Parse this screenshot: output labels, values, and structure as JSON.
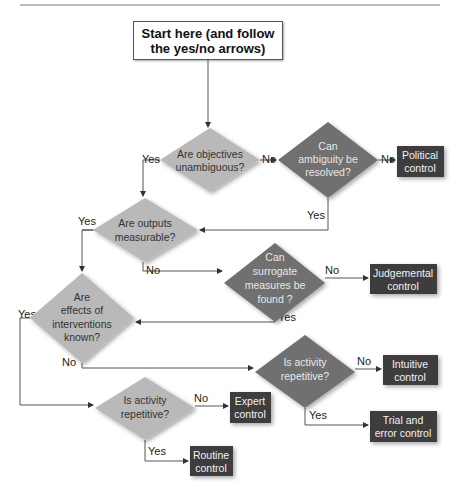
{
  "start": {
    "line1": "Start here (and follow",
    "line2": "the yes/no arrows)"
  },
  "colors": {
    "light_diamond": "#b9b9b9",
    "dark_diamond": "#6f6f6f",
    "outcome_box": "#3d3d3d",
    "line": "#555555"
  },
  "decisions": [
    {
      "id": "objectives",
      "lines": [
        "Are objectives",
        "unambiguous?"
      ],
      "shade": "light"
    },
    {
      "id": "ambiguity",
      "lines": [
        "Can",
        "ambiguity be",
        "resolved?"
      ],
      "shade": "dark"
    },
    {
      "id": "outputs",
      "lines": [
        "Are outputs",
        "measurable?"
      ],
      "shade": "light"
    },
    {
      "id": "surrogate",
      "lines": [
        "Can",
        "surrogate",
        "measures be",
        "found ?"
      ],
      "shade": "dark"
    },
    {
      "id": "effects",
      "lines": [
        "Are",
        "effects of",
        "interventions",
        "known?"
      ],
      "shade": "light"
    },
    {
      "id": "repetitive_right",
      "lines": [
        "Is activity",
        "repetitive?"
      ],
      "shade": "dark"
    },
    {
      "id": "repetitive_left",
      "lines": [
        "Is activity",
        "repetitive?"
      ],
      "shade": "light"
    }
  ],
  "outcomes": [
    {
      "id": "political",
      "lines": [
        "Political",
        "control"
      ]
    },
    {
      "id": "judgemental",
      "lines": [
        "Judgemental",
        "control"
      ]
    },
    {
      "id": "intuitive",
      "lines": [
        "Intuitive",
        "control"
      ]
    },
    {
      "id": "trial_error",
      "lines": [
        "Trial and",
        "error control"
      ]
    },
    {
      "id": "expert",
      "lines": [
        "Expert",
        "control"
      ]
    },
    {
      "id": "routine",
      "lines": [
        "Routine",
        "control"
      ]
    }
  ],
  "edge_labels": {
    "yes": "Yes",
    "no": "No"
  }
}
